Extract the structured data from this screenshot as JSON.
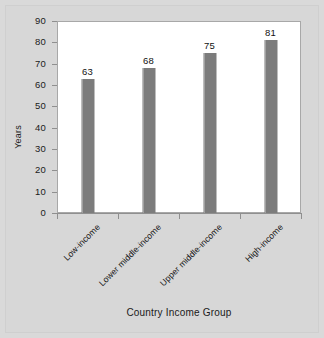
{
  "chart_data": {
    "type": "bar",
    "title": "",
    "xlabel": "Country Income Group",
    "ylabel": "Years",
    "categories": [
      "Low-income",
      "Lower middle-income",
      "Upper middle-income",
      "High-income"
    ],
    "values": [
      63,
      68,
      75,
      81
    ],
    "value_labels": [
      "63",
      "68",
      "75",
      "81"
    ],
    "ylim": [
      0,
      90
    ],
    "ytick_labels": [
      "90",
      "80",
      "70",
      "60",
      "50",
      "40",
      "30",
      "20",
      "10",
      "0"
    ],
    "ytick_values": [
      90,
      80,
      70,
      60,
      50,
      40,
      30,
      20,
      10,
      0
    ],
    "grid": false,
    "legend": false,
    "bar_color": "#7c7c7c",
    "plot_background": "#ffffff",
    "figure_background": "#d9d9d9",
    "axis_color": "#8f8f8f",
    "text_color": "#1a1a1a",
    "xtick_label_rotation": -45
  }
}
